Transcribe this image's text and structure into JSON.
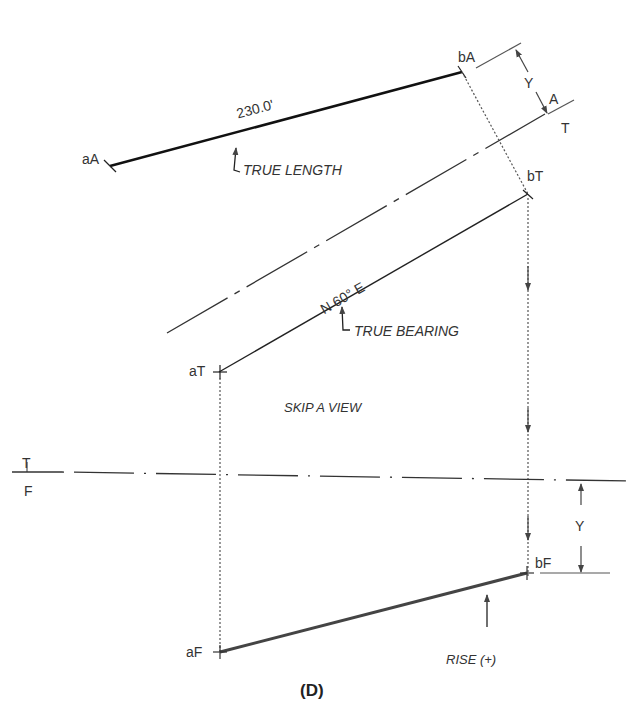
{
  "figure": {
    "caption": "(D)",
    "points": {
      "aA": "aA",
      "bA": "bA",
      "aT": "aT",
      "bT": "bT",
      "aF": "aF",
      "bF": "bF"
    },
    "fold_lines": {
      "TA": {
        "upper": "A",
        "lower": "T"
      },
      "TF": {
        "upper": "T",
        "lower": "F"
      }
    },
    "dimension": "230.0'",
    "bearing": "N 60° E",
    "annotations": {
      "true_length": "TRUE LENGTH",
      "true_bearing": "TRUE BEARING",
      "skip_view": "SKIP A VIEW",
      "rise": "RISE (+)"
    },
    "distances": {
      "y_aux": "Y",
      "y_front": "Y"
    }
  }
}
